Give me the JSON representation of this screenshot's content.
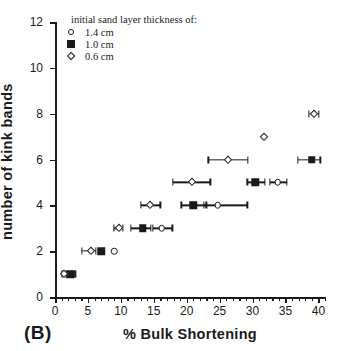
{
  "chart_data": {
    "type": "scatter",
    "title": "",
    "xlabel": "%  Bulk  Shortening",
    "ylabel": "number  of  kink  bands",
    "panel_label": "(B)",
    "xlim": [
      0,
      41
    ],
    "ylim": [
      0,
      12
    ],
    "xticks": [
      0,
      5,
      10,
      15,
      20,
      25,
      30,
      35,
      40
    ],
    "xtick_labels": [
      "0",
      "5",
      "10",
      "15",
      "20",
      "25",
      "30",
      "35",
      "40"
    ],
    "xminor_step": 1,
    "yticks": [
      0,
      2,
      4,
      6,
      8,
      10,
      12
    ],
    "ytick_labels": [
      "0",
      "2",
      "4",
      "6",
      "8",
      "10",
      "12"
    ],
    "grid": false,
    "legend_position": "top-left",
    "legend_title": "initial sand layer thickness of:",
    "series": [
      {
        "name": "1.4 cm",
        "marker": "open-circle",
        "color": "#1a1a1a",
        "points": [
          {
            "x": 2.6,
            "y": 1,
            "xerr_low": 2.1,
            "xerr_high": 3.1
          },
          {
            "x": 9.0,
            "y": 2,
            "xerr_low": 9.0,
            "xerr_high": 9.0
          },
          {
            "x": 16.2,
            "y": 3,
            "xerr_low": 14.9,
            "xerr_high": 17.8
          },
          {
            "x": 24.7,
            "y": 4,
            "xerr_low": 22.6,
            "xerr_high": 29.2
          },
          {
            "x": 33.8,
            "y": 5,
            "xerr_low": 32.6,
            "xerr_high": 35.2
          }
        ]
      },
      {
        "name": "1.0 cm",
        "marker": "filled-square",
        "color": "#1a1a1a",
        "points": [
          {
            "x": 2.3,
            "y": 1,
            "xerr_low": 1.7,
            "xerr_high": 3.0
          },
          {
            "x": 7.0,
            "y": 2,
            "xerr_low": 7.0,
            "xerr_high": 7.0
          },
          {
            "x": 13.3,
            "y": 3,
            "xerr_low": 11.5,
            "xerr_high": 14.6
          },
          {
            "x": 21.0,
            "y": 4,
            "xerr_low": 19.2,
            "xerr_high": 23.0
          },
          {
            "x": 30.4,
            "y": 5,
            "xerr_low": 29.2,
            "xerr_high": 31.9
          },
          {
            "x": 39.0,
            "y": 6,
            "xerr_low": 36.9,
            "xerr_high": 40.3
          }
        ]
      },
      {
        "name": "0.6 cm",
        "marker": "open-diamond",
        "color": "#1a1a1a",
        "points": [
          {
            "x": 1.4,
            "y": 1,
            "xerr_low": 1.1,
            "xerr_high": 1.8
          },
          {
            "x": 5.5,
            "y": 2,
            "xerr_low": 4.1,
            "xerr_high": 6.2
          },
          {
            "x": 9.7,
            "y": 3,
            "xerr_low": 8.9,
            "xerr_high": 10.3
          },
          {
            "x": 14.5,
            "y": 4,
            "xerr_low": 13.0,
            "xerr_high": 16.0
          },
          {
            "x": 20.8,
            "y": 5,
            "xerr_low": 17.9,
            "xerr_high": 23.6
          },
          {
            "x": 26.2,
            "y": 6,
            "xerr_low": 23.3,
            "xerr_high": 29.3
          },
          {
            "x": 31.8,
            "y": 7,
            "xerr_low": 31.8,
            "xerr_high": 31.8
          },
          {
            "x": 39.3,
            "y": 8,
            "xerr_low": 38.6,
            "xerr_high": 40.1
          }
        ]
      }
    ]
  },
  "legend": {
    "title": "initial sand layer thickness of:",
    "entries": [
      {
        "label": "1.4 cm",
        "marker": "open-circle"
      },
      {
        "label": "1.0 cm",
        "marker": "filled-square"
      },
      {
        "label": "0.6 cm",
        "marker": "open-diamond"
      }
    ]
  }
}
